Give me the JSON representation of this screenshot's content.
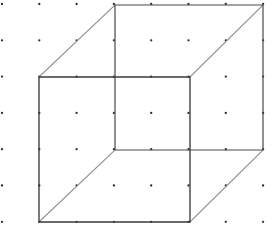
{
  "figure": {
    "canvas": {
      "width": 272,
      "height": 235,
      "background": "#ffffff"
    }
  },
  "grid": {
    "name": "dot-grid",
    "columns": 8,
    "rows": 7,
    "origin_x": 2,
    "origin_y": 4,
    "spacing_x": 37.3,
    "spacing_y": 36.3,
    "dot_radius": 1.15,
    "dot_color": "#2b2b2b",
    "dots": [
      [
        2,
        4
      ],
      [
        39.3,
        4
      ],
      [
        76.6,
        4
      ],
      [
        113.9,
        4
      ],
      [
        151.2,
        4
      ],
      [
        188.5,
        4
      ],
      [
        225.8,
        4
      ],
      [
        263.1,
        4
      ],
      [
        2,
        40.3
      ],
      [
        39.3,
        40.3
      ],
      [
        76.6,
        40.3
      ],
      [
        113.9,
        40.3
      ],
      [
        151.2,
        40.3
      ],
      [
        188.5,
        40.3
      ],
      [
        225.8,
        40.3
      ],
      [
        263.1,
        40.3
      ],
      [
        2,
        76.6
      ],
      [
        39.3,
        76.6
      ],
      [
        76.6,
        76.6
      ],
      [
        113.9,
        76.6
      ],
      [
        151.2,
        76.6
      ],
      [
        188.5,
        76.6
      ],
      [
        225.8,
        76.6
      ],
      [
        263.1,
        76.6
      ],
      [
        2,
        112.9
      ],
      [
        39.3,
        112.9
      ],
      [
        76.6,
        112.9
      ],
      [
        113.9,
        112.9
      ],
      [
        151.2,
        112.9
      ],
      [
        188.5,
        112.9
      ],
      [
        225.8,
        112.9
      ],
      [
        263.1,
        112.9
      ],
      [
        2,
        149.2
      ],
      [
        39.3,
        149.2
      ],
      [
        76.6,
        149.2
      ],
      [
        113.9,
        149.2
      ],
      [
        151.2,
        149.2
      ],
      [
        188.5,
        149.2
      ],
      [
        225.8,
        149.2
      ],
      [
        263.1,
        149.2
      ],
      [
        2,
        185.5
      ],
      [
        39.3,
        185.5
      ],
      [
        76.6,
        185.5
      ],
      [
        113.9,
        185.5
      ],
      [
        151.2,
        185.5
      ],
      [
        188.5,
        185.5
      ],
      [
        225.8,
        185.5
      ],
      [
        263.1,
        185.5
      ],
      [
        2,
        221.8
      ],
      [
        39.3,
        221.8
      ],
      [
        76.6,
        221.8
      ],
      [
        113.9,
        221.8
      ],
      [
        151.2,
        221.8
      ],
      [
        188.5,
        221.8
      ],
      [
        225.8,
        221.8
      ],
      [
        263.1,
        221.8
      ]
    ]
  },
  "cube": {
    "name": "necker-cube",
    "front_face": {
      "label": "front-square",
      "color": "#3a3a3a",
      "stroke_width": 1.35,
      "vertices": [
        {
          "id": "front-top-left",
          "x": 39,
          "y": 77
        },
        {
          "id": "front-top-right",
          "x": 190,
          "y": 77
        },
        {
          "id": "front-bottom-right",
          "x": 190,
          "y": 222
        },
        {
          "id": "front-bottom-left",
          "x": 39,
          "y": 222
        }
      ]
    },
    "back_face": {
      "label": "back-square",
      "color": "#4a4a4a",
      "stroke_width": 1.2,
      "vertices": [
        {
          "id": "back-top-left",
          "x": 115,
          "y": 5
        },
        {
          "id": "back-top-right",
          "x": 263,
          "y": 5
        },
        {
          "id": "back-bottom-right",
          "x": 263,
          "y": 150
        },
        {
          "id": "back-bottom-left",
          "x": 115,
          "y": 150
        }
      ]
    },
    "connectors": {
      "label": "depth-edges",
      "color": "#8e8e8e",
      "stroke_width": 1.15,
      "edges": [
        {
          "id": "connector-top-left",
          "x1": 39,
          "y1": 77,
          "x2": 115,
          "y2": 5
        },
        {
          "id": "connector-top-right",
          "x1": 190,
          "y1": 77,
          "x2": 263,
          "y2": 5
        },
        {
          "id": "connector-bottom-right",
          "x1": 190,
          "y1": 222,
          "x2": 263,
          "y2": 150
        },
        {
          "id": "connector-bottom-left",
          "x1": 39,
          "y1": 222,
          "x2": 115,
          "y2": 150
        }
      ]
    }
  }
}
